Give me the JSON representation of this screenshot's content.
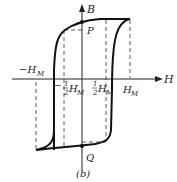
{
  "figure": {
    "caption": "(b)",
    "axis_h_label": "H",
    "axis_b_label": "B",
    "point_p_label": "P",
    "point_q_label": "Q",
    "tick_neg_hm": "−H",
    "tick_neg_hm_sub": "M",
    "tick_hm": "H",
    "tick_hm_sub": "M",
    "tick_neg_half_prefix": "−",
    "tick_half_num": "1",
    "tick_half_den": "2",
    "tick_half_h": "H",
    "tick_half_sub": "M"
  }
}
